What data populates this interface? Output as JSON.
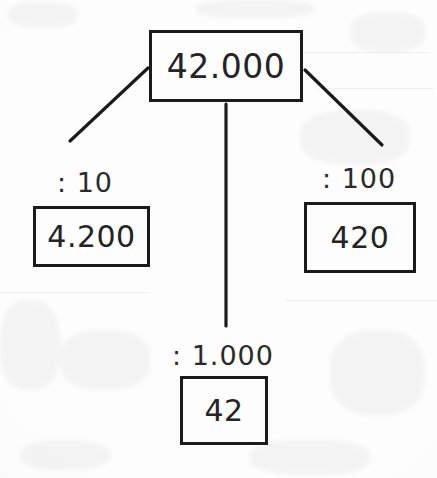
{
  "diagram": {
    "type": "division-tree",
    "root": {
      "value": "42.000"
    },
    "branches": [
      {
        "id": "left",
        "operator_label": ": 10",
        "value": "4.200"
      },
      {
        "id": "bottom",
        "operator_label": ": 1.000",
        "value": "42"
      },
      {
        "id": "right",
        "operator_label": ": 100",
        "value": "420"
      }
    ]
  },
  "style": {
    "ink_color": "#1b1b1b",
    "text_color": "#242424",
    "paper_color": "#fdfdfd"
  }
}
